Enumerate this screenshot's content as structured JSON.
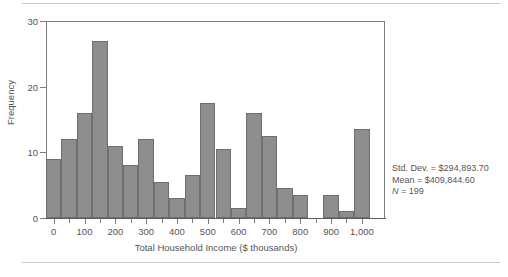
{
  "chart_data": {
    "type": "bar",
    "title": "",
    "subtitle": "",
    "xlabel": "Total Household Income ($ thousands)",
    "ylabel": "Frequency",
    "xlim": [
      -25,
      1075
    ],
    "ylim": [
      0,
      30
    ],
    "grid": false,
    "legend": null,
    "bin_width": 50,
    "bar_color": "#8d8d8d",
    "bar_edge_color": "#6f6f6f",
    "x_ticks": [
      0,
      50,
      100,
      150,
      200,
      250,
      300,
      350,
      400,
      450,
      500,
      550,
      600,
      650,
      700,
      750,
      800,
      850,
      900,
      950,
      1000
    ],
    "x_tick_labels": [
      "0",
      "",
      "100",
      "",
      "200",
      "",
      "300",
      "",
      "400",
      "",
      "500",
      "",
      "600",
      "",
      "700",
      "",
      "800",
      "",
      "900",
      "",
      "1,000"
    ],
    "y_ticks": [
      0,
      10,
      20,
      30
    ],
    "y_tick_labels": [
      "0",
      "10",
      "20",
      "30"
    ],
    "bin_starts": [
      -25,
      25,
      75,
      125,
      175,
      225,
      275,
      325,
      375,
      425,
      475,
      525,
      575,
      625,
      675,
      725,
      775,
      825,
      875,
      925,
      975
    ],
    "bin_centers": [
      0,
      50,
      100,
      150,
      200,
      250,
      300,
      350,
      400,
      450,
      500,
      550,
      600,
      650,
      700,
      750,
      800,
      850,
      900,
      950,
      1000
    ],
    "values": [
      9,
      12,
      16,
      27,
      11,
      8,
      12,
      5.5,
      3,
      6.5,
      17.5,
      10.5,
      1.5,
      16,
      12.5,
      4.5,
      3.5,
      0,
      3.5,
      1,
      13.5
    ],
    "annotations": [
      "Std. Dev. = $294,893.70",
      "Mean = $409,844.60",
      "N = 199"
    ]
  },
  "stats": {
    "std_dev_label": "Std. Dev. = ",
    "std_dev_value": "$294,893.70",
    "mean_label": "Mean = ",
    "mean_value": "$409,844.60",
    "n_label": "N",
    "n_value": " = 199"
  }
}
